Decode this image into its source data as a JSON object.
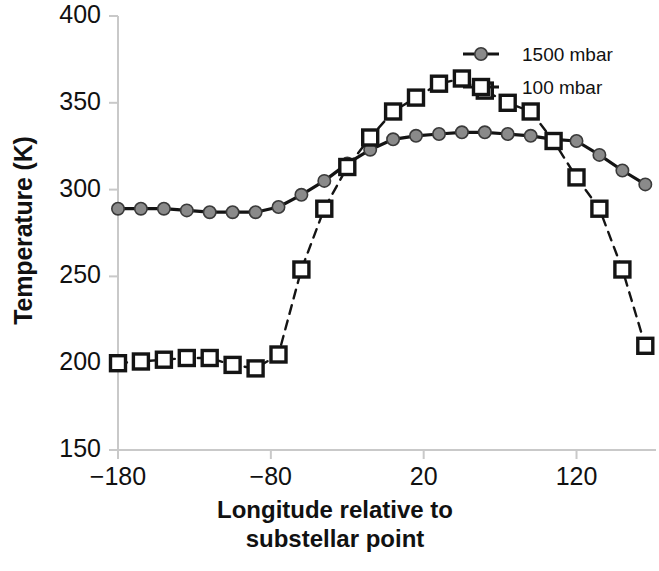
{
  "chart_data": {
    "type": "line",
    "title": "",
    "xlabel": "Longitude relative to substellar point",
    "ylabel": "Temperature (K)",
    "xlim": [
      -180,
      172
    ],
    "ylim": [
      150,
      400
    ],
    "xticks": [
      -180,
      -80,
      20,
      120
    ],
    "xtick_labels": [
      "−180",
      "−80",
      "20",
      "120"
    ],
    "yticks": [
      150,
      200,
      250,
      300,
      350,
      400
    ],
    "ytick_labels": [
      "150",
      "200",
      "250",
      "300",
      "350",
      "400"
    ],
    "grid": false,
    "legend_position": "top-right",
    "series": [
      {
        "name": "1500 mbar",
        "marker": "filled-circle",
        "marker_color": "#8a8a8a",
        "marker_edge_color": "#3a3a3a",
        "line_style": "solid",
        "line_color": "#141414",
        "x": [
          -180,
          -165,
          -150,
          -135,
          -120,
          -105,
          -90,
          -75,
          -60,
          -45,
          -30,
          -15,
          0,
          15,
          30,
          45,
          60,
          75,
          90,
          105,
          120,
          135,
          150,
          165
        ],
        "y": [
          289,
          289,
          289,
          288,
          287,
          287,
          287,
          290,
          297,
          305,
          315,
          323,
          329,
          331,
          332,
          333,
          333,
          332,
          331,
          329,
          328,
          320,
          311,
          303
        ]
      },
      {
        "name": "1500 mbar-tail",
        "marker": "filled-circle",
        "marker_color": "#8a8a8a",
        "marker_edge_color": "#3a3a3a",
        "line_style": "solid",
        "line_color": "#141414",
        "x": [],
        "y": []
      },
      {
        "name": "100 mbar",
        "marker": "open-square",
        "marker_color": "#ffffff",
        "marker_edge_color": "#141414",
        "line_style": "dashed",
        "line_color": "#141414",
        "x": [
          -180,
          -165,
          -150,
          -135,
          -120,
          -105,
          -90,
          -75,
          -60,
          -45,
          -30,
          -15,
          0,
          15,
          30,
          45,
          60,
          75,
          90,
          105,
          120,
          135,
          150,
          165
        ],
        "y": [
          200,
          201,
          202,
          203,
          203,
          199,
          197,
          205,
          254,
          289,
          313,
          330,
          345,
          353,
          361,
          364,
          357,
          350,
          345,
          328,
          307,
          289,
          254,
          210
        ]
      }
    ],
    "legend_entries": [
      {
        "label": "1500 mbar",
        "marker": "filled-circle",
        "color": "#8a8a8a",
        "line_style": "solid"
      },
      {
        "label": "100 mbar",
        "marker": "open-square",
        "color": "#ffffff",
        "line_style": "solid"
      }
    ]
  },
  "axes": {
    "y_title": "Temperature (K)",
    "x_title_line1": "Longitude relative to",
    "x_title_line2": "substellar point"
  },
  "legend": {
    "entry1_label": "1500 mbar",
    "entry2_label": "100 mbar"
  },
  "colors": {
    "axis": "#c9c9c9",
    "line": "#141414",
    "circle_fill": "#8a8a8a",
    "square_fill": "#ffffff",
    "text": "#111111"
  }
}
